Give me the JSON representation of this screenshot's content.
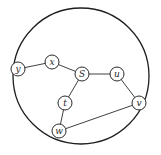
{
  "diagram": {
    "type": "graph",
    "boundary": {
      "cx": 81,
      "cy": 76,
      "r": 68,
      "stroke": "#1e1e1e"
    },
    "node_radius": 7,
    "colors": {
      "stroke": "#2a2a2a",
      "fill": "#ffffff",
      "text": "#2a2a2a"
    },
    "nodes": [
      {
        "id": "y",
        "label": "y",
        "x": 18,
        "y": 69
      },
      {
        "id": "x",
        "label": "x",
        "x": 52,
        "y": 62
      },
      {
        "id": "S",
        "label": "S",
        "x": 82,
        "y": 74
      },
      {
        "id": "u",
        "label": "u",
        "x": 117,
        "y": 74
      },
      {
        "id": "v",
        "label": "v",
        "x": 139,
        "y": 103
      },
      {
        "id": "t",
        "label": "t",
        "x": 65,
        "y": 103
      },
      {
        "id": "w",
        "label": "w",
        "x": 59,
        "y": 131
      }
    ],
    "edges": [
      {
        "from": "y",
        "to": "x"
      },
      {
        "from": "x",
        "to": "S"
      },
      {
        "from": "S",
        "to": "u"
      },
      {
        "from": "u",
        "to": "v"
      },
      {
        "from": "S",
        "to": "t"
      },
      {
        "from": "t",
        "to": "w"
      },
      {
        "from": "w",
        "to": "v"
      }
    ]
  }
}
